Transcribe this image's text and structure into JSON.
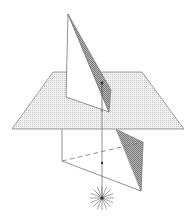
{
  "figure": {
    "colors": {
      "background": "#ffffff",
      "stroke": "#777777",
      "plane_fill": "#e6e6e6",
      "shade_fill": "#9a9a9a",
      "ray": "#666666",
      "light": "#555555"
    },
    "elements": [
      "horizontal-plane",
      "upper-triangle",
      "upper-shaded-face",
      "lower-vertical-edge",
      "lower-dashed-edge",
      "lower-solid-edge",
      "lower-shaded-face",
      "vertical-ray",
      "point-upper",
      "point-lower",
      "light-source"
    ]
  }
}
